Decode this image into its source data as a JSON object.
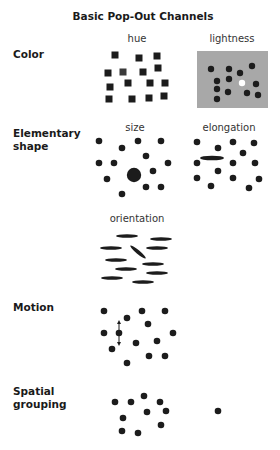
{
  "title": "Basic Pop-Out Channels",
  "categories": {
    "color": "Color",
    "shape": "Elementary\nshape",
    "motion": "Motion",
    "spatial": "Spatial\ngrouping"
  },
  "panels": {
    "hue": "hue",
    "lightness": "lightness",
    "size": "size",
    "elongation": "elongation",
    "orientation": "orientation"
  },
  "colors": {
    "mark": "#1c1c1c",
    "hue_target": "#3a3a3a",
    "lightness_bg": "#a8a8a8",
    "lightness_target": "#ffffff"
  },
  "marks": {
    "hue_squares": [
      [
        115,
        55
      ],
      [
        139,
        58
      ],
      [
        157,
        56
      ],
      [
        108,
        73
      ],
      [
        143,
        72
      ],
      [
        158,
        68
      ],
      [
        110,
        87
      ],
      [
        128,
        83
      ],
      [
        150,
        83
      ],
      [
        165,
        83
      ],
      [
        109,
        99
      ],
      [
        132,
        99
      ],
      [
        149,
        98
      ],
      [
        164,
        96
      ]
    ],
    "hue_target": [
      123,
      72
    ],
    "lightness_panel": [
      197,
      51,
      71,
      57
    ],
    "lightness_dots": [
      [
        211,
        69
      ],
      [
        229,
        69
      ],
      [
        240,
        73
      ],
      [
        252,
        66
      ],
      [
        217,
        81
      ],
      [
        229,
        79
      ],
      [
        256,
        84
      ],
      [
        217,
        89
      ],
      [
        228,
        92
      ],
      [
        247,
        93
      ],
      [
        258,
        95
      ],
      [
        217,
        99
      ]
    ],
    "lightness_target": [
      242,
      83
    ],
    "size_dots": [
      [
        99,
        141
      ],
      [
        122,
        148
      ],
      [
        138,
        141
      ],
      [
        161,
        141
      ],
      [
        146,
        156
      ],
      [
        99,
        163
      ],
      [
        114,
        163
      ],
      [
        168,
        163
      ],
      [
        107,
        179
      ],
      [
        153,
        171
      ],
      [
        146,
        187
      ],
      [
        161,
        187
      ],
      [
        122,
        194
      ]
    ],
    "size_target": [
      134,
      175
    ],
    "elongation_dots": [
      [
        197,
        142
      ],
      [
        218,
        148
      ],
      [
        233,
        142
      ],
      [
        254,
        143
      ],
      [
        243,
        153
      ],
      [
        197,
        163
      ],
      [
        218,
        171
      ],
      [
        233,
        163
      ],
      [
        255,
        163
      ],
      [
        197,
        178
      ],
      [
        211,
        186
      ],
      [
        233,
        178
      ],
      [
        259,
        179
      ],
      [
        249,
        188
      ]
    ],
    "elongation_target": [
      212,
      158
    ],
    "orientation_bars": [
      [
        127,
        236
      ],
      [
        161,
        239
      ],
      [
        111,
        248
      ],
      [
        157,
        248
      ],
      [
        116,
        260
      ],
      [
        153,
        264
      ],
      [
        126,
        269
      ],
      [
        157,
        273
      ],
      [
        112,
        278
      ],
      [
        143,
        282
      ]
    ],
    "orientation_target": [
      138,
      252
    ],
    "motion_dots": [
      [
        104,
        311
      ],
      [
        127,
        318
      ],
      [
        142,
        311
      ],
      [
        165,
        311
      ],
      [
        148,
        324
      ],
      [
        104,
        333
      ],
      [
        173,
        333
      ],
      [
        136,
        343
      ],
      [
        157,
        341
      ],
      [
        112,
        349
      ],
      [
        149,
        356
      ],
      [
        165,
        356
      ],
      [
        127,
        363
      ]
    ],
    "motion_target": [
      119,
      333
    ],
    "spatial_dots": [
      [
        115,
        402
      ],
      [
        131,
        402
      ],
      [
        144,
        396
      ],
      [
        160,
        402
      ],
      [
        147,
        412
      ],
      [
        166,
        411
      ],
      [
        123,
        418
      ],
      [
        161,
        425
      ],
      [
        122,
        431
      ],
      [
        138,
        433
      ]
    ],
    "spatial_outlier": [
      218,
      411
    ]
  }
}
